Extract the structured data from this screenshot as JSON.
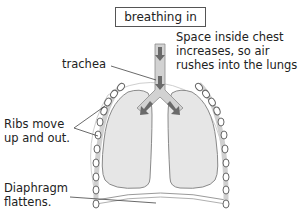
{
  "title": "breathing in",
  "labels": {
    "space": "Space inside chest\nincreases, so air\nrushes into the lungs.",
    "trachea": "trachea",
    "ribs": "Ribs move\nup and out.",
    "diaphragm": "Diaphragm\nflattens."
  },
  "colors": {
    "lung_fill": "#e6e6e6",
    "outline": "#8a8a8a",
    "trachea_fill": "#d2d2d2",
    "arrow": "#6a6a6a",
    "rib_fill": "#ffffff",
    "text": "#222222"
  }
}
